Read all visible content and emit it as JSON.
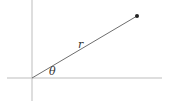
{
  "diagram": {
    "type": "polar-coordinate",
    "radius_label": "r",
    "angle_label": "θ",
    "colors": {
      "axis": "#bdbdbd",
      "radius_line": "#6e6e6e",
      "point": "#222222",
      "label": "#333333"
    }
  }
}
